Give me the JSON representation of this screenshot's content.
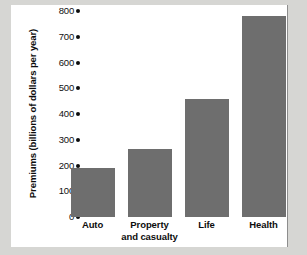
{
  "chart_data": {
    "type": "bar",
    "title": "",
    "xlabel": "",
    "ylabel": "Premiums (billions of dollars per year)",
    "categories": [
      "Auto",
      "Property and casualty",
      "Life",
      "Health"
    ],
    "category_lines": [
      [
        "Auto"
      ],
      [
        "Property",
        "and casualty"
      ],
      [
        "Life"
      ],
      [
        "Health"
      ]
    ],
    "values": [
      190,
      265,
      460,
      780
    ],
    "ylim": [
      0,
      800
    ],
    "ytick_values": [
      0,
      100,
      200,
      300,
      400,
      500,
      600,
      700,
      800
    ],
    "ytick_labels": [
      "0",
      "100",
      "200",
      "300",
      "400",
      "500",
      "600",
      "700",
      "800"
    ],
    "ytick_marker": "filled-circle",
    "grid": false,
    "legend": false,
    "bar_color": "#6e6e6e",
    "panel_color": "#ffffff",
    "figure_color": "#d6d6d3",
    "text_color": "#0d0d0d"
  }
}
